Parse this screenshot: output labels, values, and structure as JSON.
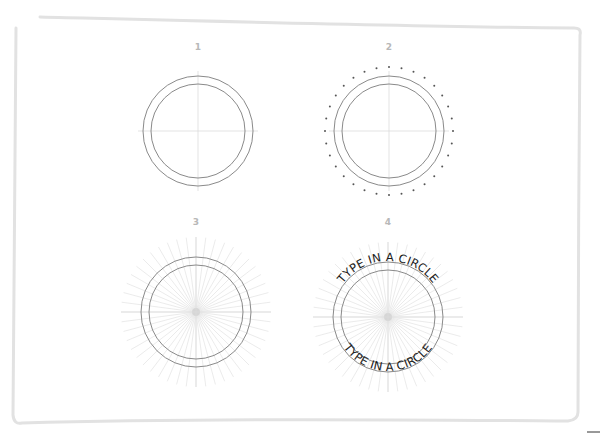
{
  "frame": {
    "stroke_color": "#e2e2e2",
    "stroke_width": 3
  },
  "corner_mark": {
    "color": "#333333"
  },
  "colors": {
    "circle_stroke": "#8a8a8a",
    "guide_line": "#dcdcdc",
    "ray": "#e6e6e6",
    "dot": "#555555",
    "label": "#b8b8b8",
    "text": "#1a1a1a"
  },
  "geometry": {
    "outer_radius": 55,
    "inner_radius": 47,
    "dot_ring_radius": 64,
    "dot_count": 32,
    "ray_count": 48,
    "ray_length": 75,
    "guide_length": 60
  },
  "steps": [
    {
      "number": "1",
      "center_x": 198,
      "center_y": 131,
      "label_y": 50,
      "shows_guides": true,
      "shows_dots": false,
      "shows_rays": false,
      "shows_text": false
    },
    {
      "number": "2",
      "center_x": 389,
      "center_y": 131,
      "label_y": 50,
      "shows_guides": true,
      "shows_dots": true,
      "shows_rays": false,
      "shows_text": false
    },
    {
      "number": "3",
      "center_x": 196,
      "center_y": 312,
      "label_y": 225,
      "shows_guides": true,
      "shows_dots": false,
      "shows_rays": true,
      "shows_text": false
    },
    {
      "number": "4",
      "center_x": 388,
      "center_y": 317,
      "label_y": 225,
      "shows_guides": true,
      "shows_dots": false,
      "shows_rays": true,
      "shows_text": true
    }
  ],
  "circle_text": {
    "top": "TYPE IN A CIRCLE",
    "bottom": "TYPE IN A CIRCLE"
  }
}
